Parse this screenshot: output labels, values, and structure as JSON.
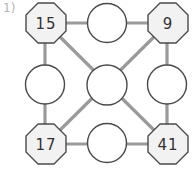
{
  "problem": {
    "label": "1)"
  },
  "colors": {
    "line": "#9a9a9a",
    "node_border": "#4a4a4a",
    "octagon_fill": "#f2f2f2",
    "circle_fill": "#ffffff",
    "text": "#333333"
  },
  "corners": [
    {
      "id": "top-left",
      "value": "15"
    },
    {
      "id": "top-right",
      "value": "9"
    },
    {
      "id": "bottom-left",
      "value": "17"
    },
    {
      "id": "bottom-right",
      "value": "41"
    }
  ],
  "blanks": [
    {
      "id": "top",
      "value": ""
    },
    {
      "id": "left",
      "value": ""
    },
    {
      "id": "center",
      "value": ""
    },
    {
      "id": "right",
      "value": ""
    },
    {
      "id": "bottom",
      "value": ""
    }
  ]
}
